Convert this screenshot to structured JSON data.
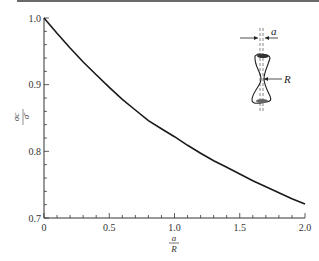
{
  "chart_data": {
    "type": "line",
    "title": "",
    "xlabel": "a/R",
    "xlabel_num": "a",
    "xlabel_den": "R",
    "ylabel": "σc/σ̄",
    "ylabel_num": "σc",
    "ylabel_den": "σ̄",
    "xlim": [
      0,
      2.0
    ],
    "ylim": [
      0.7,
      1.0
    ],
    "x_ticks": [
      0,
      0.5,
      1.0,
      1.5,
      2.0
    ],
    "x_tick_labels": [
      "0",
      "0.5",
      "1.0",
      "1.5",
      "2.0"
    ],
    "x_minor_step": 0.1,
    "y_ticks": [
      0.7,
      0.8,
      0.9,
      1.0
    ],
    "y_tick_labels": [
      "0.7",
      "0.8",
      "0.9",
      "1.0"
    ],
    "y_minor_step": 0.02,
    "grid": false,
    "series": [
      {
        "name": "Bridgman correction",
        "x": [
          0,
          0.1,
          0.2,
          0.3,
          0.4,
          0.5,
          0.6,
          0.7,
          0.8,
          0.9,
          1.0,
          1.1,
          1.2,
          1.3,
          1.4,
          1.5,
          1.6,
          1.7,
          1.8,
          1.9,
          2.0
        ],
        "y": [
          1.0,
          0.977,
          0.955,
          0.934,
          0.915,
          0.896,
          0.878,
          0.862,
          0.846,
          0.834,
          0.822,
          0.809,
          0.797,
          0.786,
          0.776,
          0.766,
          0.756,
          0.747,
          0.738,
          0.729,
          0.721
        ]
      }
    ],
    "inset": {
      "description": "necked specimen sketch",
      "label_a": "a",
      "label_R": "R"
    }
  }
}
